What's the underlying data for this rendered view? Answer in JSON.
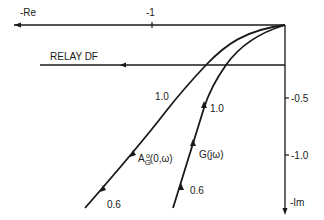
{
  "diagram": {
    "type": "nyquist-describing-function-plot",
    "axes": {
      "real_axis_label": "-Re",
      "imag_axis_label": "-Im",
      "real_ticks": [
        {
          "value": -1,
          "label": "-1"
        }
      ],
      "imag_ticks": [
        {
          "value": -0.5,
          "label": "-0.5"
        },
        {
          "value": -1.0,
          "label": "-1.0"
        }
      ]
    },
    "relay_line": {
      "label": "RELAY DF"
    },
    "curves": [
      {
        "name": "A_G^0(0,ω)",
        "label_main": "A",
        "label_sup": "o",
        "label_sub": "G",
        "label_args": "(0,ω)",
        "points": [
          {
            "label": "1.0"
          },
          {
            "label": "0.6"
          }
        ]
      },
      {
        "name": "G(jω)",
        "label": "G(jω)",
        "points": [
          {
            "label": "1.0"
          },
          {
            "label": "0.6"
          }
        ]
      }
    ],
    "colors": {
      "line": "#1a1a1a",
      "background": "#ffffff"
    }
  }
}
